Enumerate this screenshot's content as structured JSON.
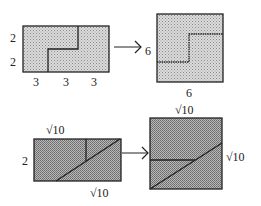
{
  "colors": {
    "light_fill": "#cfcfcf",
    "dark_fill": "#a8a8a8",
    "stroke": "#222222",
    "background": "#ffffff"
  },
  "top": {
    "left_rect": {
      "side_labels": [
        "2",
        "2"
      ],
      "bottom_labels": [
        "3",
        "3",
        "3"
      ]
    },
    "arrow": "right-arrow",
    "right_square": {
      "left_label": "6",
      "bottom_label": "6"
    }
  },
  "bottom": {
    "left_rect": {
      "top_label": "√10",
      "left_label": "2",
      "bottom_label": "√10"
    },
    "arrow": "right-arrow",
    "right_square": {
      "top_label": "√10",
      "right_label": "√10"
    }
  }
}
